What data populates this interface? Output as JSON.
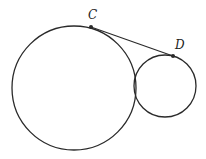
{
  "diagram": {
    "type": "geometry",
    "stroke_color": "#2a2a2a",
    "large_circle": {
      "cx": 74,
      "cy": 88,
      "r": 62
    },
    "small_circle": {
      "cx": 165,
      "cy": 86,
      "r": 31
    },
    "points": [
      {
        "label": "C",
        "x": 91,
        "y": 27,
        "label_x": 88,
        "label_y": 19
      },
      {
        "label": "D",
        "x": 173,
        "y": 56,
        "label_x": 175,
        "label_y": 49
      }
    ],
    "segments": [
      {
        "from": "C",
        "to": "D"
      }
    ]
  }
}
